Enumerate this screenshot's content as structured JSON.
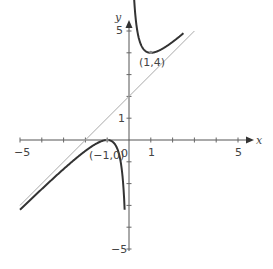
{
  "chart_data": {
    "type": "line",
    "title": "",
    "xlabel": "x",
    "ylabel": "y",
    "xlim": [
      -5,
      5.5
    ],
    "ylim": [
      -5,
      5.2
    ],
    "grid": false,
    "x_ticks": [
      -5,
      -4,
      -3,
      -2,
      -1,
      1,
      2,
      3,
      4,
      5
    ],
    "x_tick_labels": [
      {
        "value": -5,
        "text": "-5"
      },
      {
        "value": 1,
        "text": "1"
      },
      {
        "value": 5,
        "text": "5"
      }
    ],
    "y_ticks": [
      -5,
      -4,
      -3,
      -2,
      -1,
      1,
      2,
      3,
      4,
      5
    ],
    "y_tick_labels": [
      {
        "value": 5,
        "text": "5"
      },
      {
        "value": 1,
        "text": "1"
      },
      {
        "value": -5,
        "text": "-5"
      }
    ],
    "origin_label": "0",
    "series": [
      {
        "name": "curve",
        "equation": "y = x + 2 + 1/x",
        "color": "#333333",
        "branches": [
          {
            "x_from": -5,
            "x_to": -0.2
          },
          {
            "x_from": 0.2,
            "x_to": 2.5
          }
        ]
      },
      {
        "name": "asymptote",
        "equation": "y = x + 2",
        "color": "#aaaaaa",
        "x_from": -5,
        "x_to": 3
      }
    ],
    "annotations": [
      {
        "point": [
          1,
          4
        ],
        "text": "(1,4)"
      },
      {
        "point": [
          -1,
          0
        ],
        "text": "(-1,0)"
      }
    ]
  },
  "labels": {
    "x_axis": "x",
    "y_axis": "y",
    "origin": "0",
    "xtick_neg5": "−5",
    "xtick_1": "1",
    "xtick_5": "5",
    "ytick_5": "5",
    "ytick_1": "1",
    "ytick_neg5": "−5",
    "ann_min": "(1,4)",
    "ann_max": "(−1,0)"
  }
}
